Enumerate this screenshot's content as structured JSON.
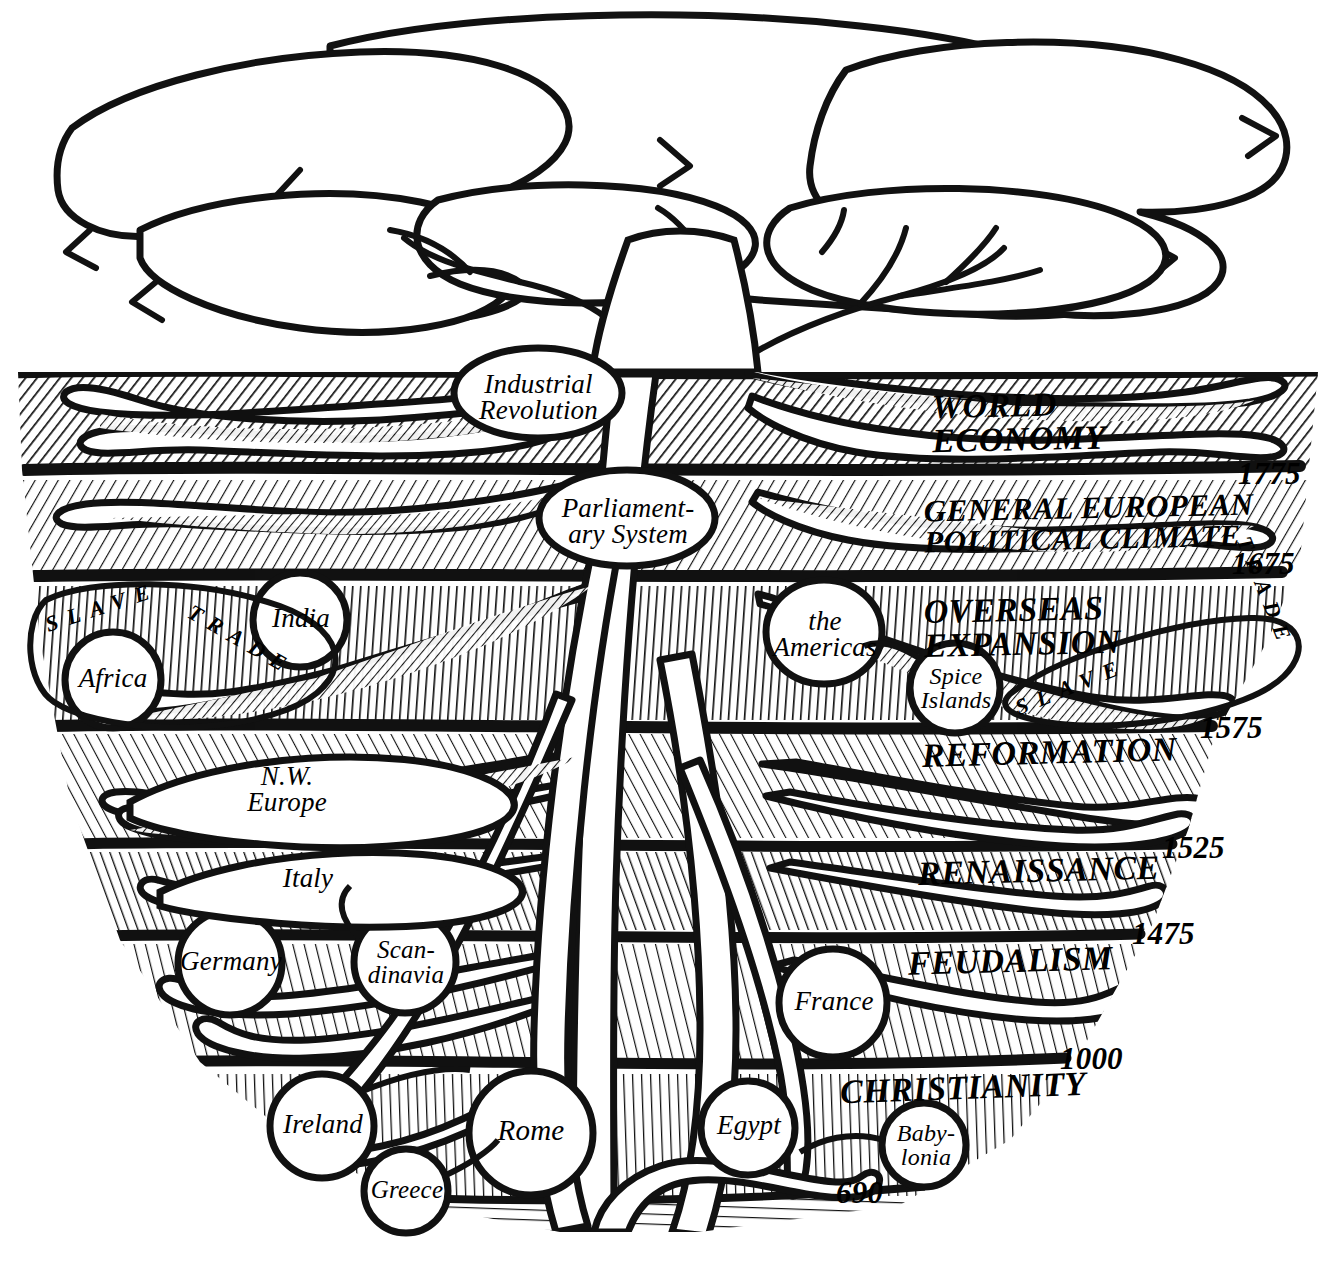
{
  "figure": {
    "kind": "hand-drawn pen-and-ink tree diagram"
  },
  "ground": {
    "line_label": "",
    "above_ground": "tree canopy and trunk",
    "below_ground": "layered soil strata with roots"
  },
  "strata": [
    {
      "id": "world-economy",
      "era": "WORLD\nECONOMY",
      "era_line1": "WORLD",
      "era_line2": "ECONOMY",
      "date": "1775"
    },
    {
      "id": "political-climate",
      "era": "GENERAL EUROPEAN\nPOLITICAL CLIMATE",
      "era_line1": "GENERAL EUROPEAN",
      "era_line2": "POLITICAL CLIMATE",
      "date": "1675"
    },
    {
      "id": "overseas-expansion",
      "era": "OVERSEAS\nEXPANSION",
      "era_line1": "OVERSEAS",
      "era_line2": "EXPANSION",
      "date": "1575"
    },
    {
      "id": "reformation",
      "era": "REFORMATION",
      "era_line1": "REFORMATION",
      "era_line2": "",
      "date": "1525"
    },
    {
      "id": "renaissance",
      "era": "RENAISSANCE",
      "era_line1": "RENAISSANCE",
      "era_line2": "",
      "date": "1475"
    },
    {
      "id": "feudalism",
      "era": "FEUDALISM",
      "era_line1": "FEUDALISM",
      "era_line2": "",
      "date": "1000"
    },
    {
      "id": "christianity",
      "era": "CHRISTIANITY",
      "era_line1": "CHRISTIANITY",
      "era_line2": "",
      "date": "690"
    }
  ],
  "nodes": [
    {
      "id": "industrial-revolution",
      "label": "Industrial\nRevolution",
      "line1": "Industrial",
      "line2": "Revolution",
      "shape": "ellipse",
      "side": "center-left"
    },
    {
      "id": "parliamentary-system",
      "label": "Parliament-\nary System",
      "line1": "Parliament-",
      "line2": "ary System",
      "shape": "ellipse",
      "side": "center"
    },
    {
      "id": "africa",
      "label": "Africa",
      "line1": "Africa",
      "line2": "",
      "shape": "circle",
      "side": "left"
    },
    {
      "id": "india",
      "label": "India",
      "line1": "India",
      "line2": "",
      "shape": "circle",
      "side": "left"
    },
    {
      "id": "the-americas",
      "label": "the\nAmericas",
      "line1": "the",
      "line2": "Americas",
      "shape": "circle",
      "side": "right"
    },
    {
      "id": "spice-islands",
      "label": "Spice\nIslands",
      "line1": "Spice",
      "line2": "Islands",
      "shape": "circle",
      "side": "right"
    },
    {
      "id": "nw-europe",
      "label": "N.W.\nEurope",
      "line1": "N.W.",
      "line2": "Europe",
      "shape": "root-lens",
      "side": "left"
    },
    {
      "id": "italy",
      "label": "Italy",
      "line1": "Italy",
      "line2": "",
      "shape": "root-lens",
      "side": "left"
    },
    {
      "id": "germany",
      "label": "Germany",
      "line1": "Germany",
      "line2": "",
      "shape": "circle",
      "side": "left"
    },
    {
      "id": "scandinavia",
      "label": "Scan-\ndinavia",
      "line1": "Scan-",
      "line2": "dinavia",
      "shape": "circle",
      "side": "left"
    },
    {
      "id": "france",
      "label": "France",
      "line1": "France",
      "line2": "",
      "shape": "circle",
      "side": "right"
    },
    {
      "id": "ireland",
      "label": "Ireland",
      "line1": "Ireland",
      "line2": "",
      "shape": "circle",
      "side": "left"
    },
    {
      "id": "greece",
      "label": "Greece",
      "line1": "Greece",
      "line2": "",
      "shape": "circle",
      "side": "left"
    },
    {
      "id": "rome",
      "label": "Rome",
      "line1": "Rome",
      "line2": "",
      "shape": "circle",
      "side": "left"
    },
    {
      "id": "egypt",
      "label": "Egypt",
      "line1": "Egypt",
      "line2": "",
      "shape": "circle",
      "side": "right"
    },
    {
      "id": "babylonia",
      "label": "Baby-\nlonia",
      "line1": "Baby-",
      "line2": "lonia",
      "shape": "circle",
      "side": "right"
    }
  ],
  "curved_labels": [
    {
      "id": "slave-trade-left",
      "text": "SLAVE TRADE",
      "part1": "SLAVE",
      "part2": "TRADE",
      "side": "left"
    },
    {
      "id": "slave-trade-right",
      "text": "SLAVE TRADE",
      "part1": "SLAVE",
      "part2": "TRADE",
      "side": "right"
    }
  ],
  "colors": {
    "ink": "#000000",
    "paper": "#ffffff"
  }
}
